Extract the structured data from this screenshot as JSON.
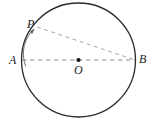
{
  "figure": {
    "kind": "geometry-diagram",
    "background_color": "#ffffff",
    "stroke_color": "#2b2b2b",
    "dash_color": "#8c8c8c",
    "arrow_color": "#555555",
    "label_color": "#1a1a1a",
    "circle": {
      "center_x": 78.5,
      "center_y": 60,
      "radius": 57,
      "stroke_width": 1.3
    },
    "points": [
      {
        "name": "A",
        "label": "A",
        "x": 22,
        "y": 60,
        "label_x": 9,
        "label_y": 54,
        "dot": false
      },
      {
        "name": "B",
        "label": "B",
        "x": 135,
        "y": 60,
        "label_x": 139,
        "label_y": 53,
        "dot": false
      },
      {
        "name": "P",
        "label": "P",
        "x": 37,
        "y": 27,
        "label_x": 27,
        "label_y": 18,
        "dot": false
      },
      {
        "name": "O",
        "label": "O",
        "x": 78.5,
        "y": 60,
        "label_x": 74,
        "label_y": 64,
        "dot": true
      }
    ],
    "segments": [
      {
        "name": "diameter-AB",
        "from": "A",
        "to": "B",
        "style": "dashed"
      },
      {
        "name": "chord-PB",
        "from": "P",
        "to": "B",
        "style": "dashed"
      }
    ],
    "arc_arrow": {
      "name": "arc-arrow-A-to-P",
      "from": "A",
      "to": "P",
      "direction": "counterclockwise",
      "has_arrowhead": true
    }
  }
}
